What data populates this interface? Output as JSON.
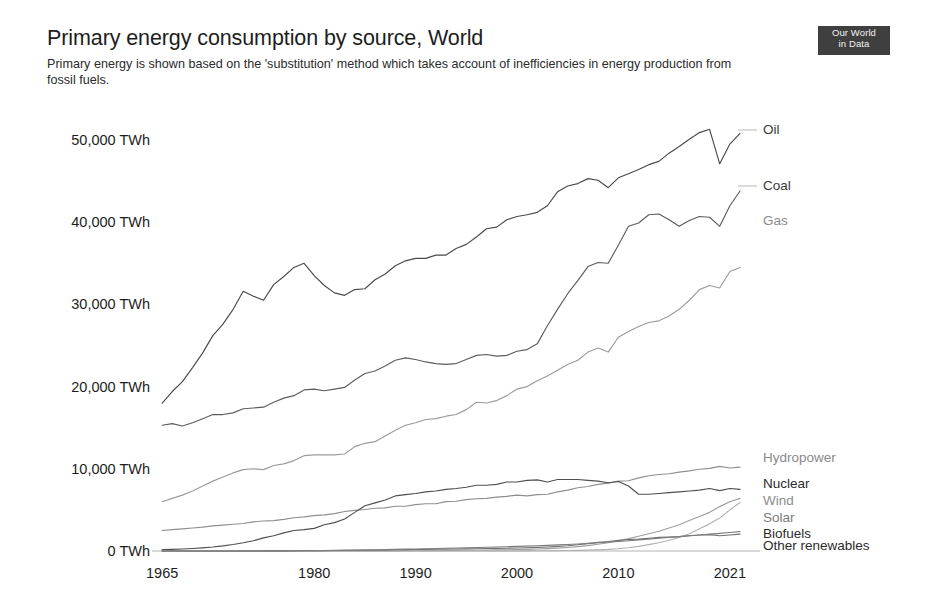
{
  "header": {
    "title": "Primary energy consumption by source, World",
    "subtitle": "Primary energy is shown based on the 'substitution' method which takes account of inefficiencies in energy production from fossil fuels.",
    "logo_line1": "Our World",
    "logo_line2": "in Data"
  },
  "chart_data": {
    "type": "line",
    "title": "Primary energy consumption by source, World",
    "subtitle": "Primary energy is shown based on the 'substitution' method which takes account of inefficiencies in energy production from fossil fuels.",
    "xlabel": "",
    "ylabel": "TWh",
    "xlim": [
      1964,
      2022
    ],
    "ylim": [
      0,
      55000
    ],
    "grid": false,
    "legend_position": "right-inline",
    "x_tick_labels": [
      "1965",
      "1980",
      "1990",
      "2000",
      "2010",
      "2021"
    ],
    "x_ticks": [
      1965,
      1980,
      1990,
      2000,
      2010,
      2021
    ],
    "y_tick_labels": [
      "0 TWh",
      "10,000 TWh",
      "20,000 TWh",
      "30,000 TWh",
      "40,000 TWh",
      "50,000 TWh"
    ],
    "y_ticks": [
      0,
      10000,
      20000,
      30000,
      40000,
      50000
    ],
    "x": [
      1965,
      1966,
      1967,
      1968,
      1969,
      1970,
      1971,
      1972,
      1973,
      1974,
      1975,
      1976,
      1977,
      1978,
      1979,
      1980,
      1981,
      1982,
      1983,
      1984,
      1985,
      1986,
      1987,
      1988,
      1989,
      1990,
      1991,
      1992,
      1993,
      1994,
      1995,
      1996,
      1997,
      1998,
      1999,
      2000,
      2001,
      2002,
      2003,
      2004,
      2005,
      2006,
      2007,
      2008,
      2009,
      2010,
      2011,
      2012,
      2013,
      2014,
      2015,
      2016,
      2017,
      2018,
      2019,
      2020,
      2021,
      2022
    ],
    "series": [
      {
        "name": "Oil",
        "color": "#4a4a4a",
        "label_color": "#3a3a3a",
        "values": [
          18000,
          19400,
          20600,
          22300,
          24100,
          26200,
          27600,
          29400,
          31600,
          31000,
          30500,
          32400,
          33400,
          34500,
          35000,
          33500,
          32300,
          31400,
          31100,
          31800,
          31900,
          33000,
          33700,
          34700,
          35300,
          35600,
          35600,
          36000,
          36000,
          36800,
          37300,
          38200,
          39200,
          39400,
          40300,
          40700,
          40900,
          41200,
          42000,
          43700,
          44400,
          44700,
          45300,
          45100,
          44200,
          45400,
          45900,
          46400,
          47000,
          47400,
          48400,
          49200,
          50100,
          50900,
          51300,
          47100,
          49500,
          50800
        ]
      },
      {
        "name": "Coal",
        "color": "#5d5d5d",
        "label_color": "#3a3a3a",
        "values": [
          15300,
          15500,
          15200,
          15600,
          16100,
          16600,
          16600,
          16800,
          17300,
          17400,
          17500,
          18100,
          18600,
          18900,
          19600,
          19700,
          19500,
          19700,
          19900,
          20800,
          21600,
          21900,
          22500,
          23200,
          23500,
          23300,
          23000,
          22800,
          22700,
          22800,
          23300,
          23800,
          23900,
          23700,
          23800,
          24300,
          24500,
          25200,
          27400,
          29400,
          31300,
          32900,
          34600,
          35100,
          35000,
          37200,
          39500,
          39900,
          40900,
          41000,
          40300,
          39500,
          40200,
          40700,
          40600,
          39500,
          42000,
          43800
        ]
      },
      {
        "name": "Gas",
        "color": "#9b9b9b",
        "label_color": "#8a8a8a",
        "values": [
          6000,
          6400,
          6800,
          7300,
          7900,
          8500,
          9000,
          9500,
          9900,
          10000,
          9900,
          10400,
          10600,
          11000,
          11600,
          11700,
          11700,
          11700,
          11800,
          12700,
          13100,
          13300,
          14000,
          14700,
          15300,
          15600,
          16000,
          16100,
          16400,
          16600,
          17200,
          18100,
          18000,
          18300,
          18900,
          19700,
          20000,
          20700,
          21300,
          22000,
          22700,
          23200,
          24200,
          24700,
          24200,
          26000,
          26700,
          27300,
          27800,
          28000,
          28600,
          29400,
          30500,
          31800,
          32300,
          32000,
          34000,
          34500
        ]
      },
      {
        "name": "Hydropower",
        "color": "#8f8f8f",
        "label_color": "#8a8a8a",
        "values": [
          2500,
          2600,
          2700,
          2800,
          2900,
          3050,
          3150,
          3250,
          3350,
          3550,
          3650,
          3700,
          3850,
          4050,
          4150,
          4300,
          4400,
          4550,
          4800,
          4950,
          5050,
          5200,
          5250,
          5450,
          5450,
          5650,
          5750,
          5750,
          6000,
          6050,
          6250,
          6350,
          6400,
          6550,
          6650,
          6800,
          6700,
          6850,
          6900,
          7200,
          7400,
          7700,
          7850,
          8100,
          8250,
          8500,
          8550,
          8900,
          9150,
          9300,
          9400,
          9600,
          9750,
          9950,
          10050,
          10300,
          10100,
          10200
        ]
      },
      {
        "name": "Nuclear",
        "color": "#4f4f4f",
        "label_color": "#2b2b2b",
        "values": [
          160,
          200,
          240,
          300,
          380,
          480,
          620,
          790,
          1000,
          1250,
          1600,
          1850,
          2200,
          2500,
          2600,
          2750,
          3200,
          3450,
          3900,
          4700,
          5500,
          5850,
          6200,
          6700,
          6850,
          7000,
          7200,
          7300,
          7500,
          7600,
          7750,
          8000,
          8000,
          8100,
          8400,
          8400,
          8600,
          8650,
          8400,
          8700,
          8700,
          8700,
          8600,
          8500,
          8300,
          8450,
          7900,
          6900,
          6900,
          7000,
          7100,
          7200,
          7300,
          7400,
          7600,
          7350,
          7600,
          7500
        ]
      },
      {
        "name": "Wind",
        "color": "#9e9e9e",
        "label_color": "#8d8d8d",
        "values": [
          0,
          0,
          0,
          0,
          0,
          0,
          0,
          0,
          0,
          0,
          0,
          0,
          0,
          0,
          0,
          0,
          0,
          0,
          0,
          5,
          8,
          12,
          16,
          20,
          25,
          30,
          38,
          48,
          58,
          70,
          85,
          95,
          110,
          130,
          150,
          175,
          200,
          240,
          290,
          350,
          430,
          530,
          650,
          820,
          1000,
          1250,
          1500,
          1800,
          2100,
          2400,
          2800,
          3200,
          3700,
          4200,
          4700,
          5400,
          6000,
          6400
        ]
      },
      {
        "name": "Solar",
        "color": "#b0b0b0",
        "label_color": "#7a7a7a",
        "values": [
          0,
          0,
          0,
          0,
          0,
          0,
          0,
          0,
          0,
          0,
          0,
          0,
          0,
          0,
          0,
          0,
          0,
          0,
          0,
          0,
          0,
          0,
          0,
          0,
          0,
          1,
          2,
          3,
          4,
          5,
          6,
          8,
          10,
          12,
          14,
          16,
          20,
          25,
          32,
          42,
          55,
          75,
          100,
          140,
          190,
          270,
          390,
          560,
          780,
          1000,
          1300,
          1650,
          2100,
          2700,
          3300,
          4000,
          5000,
          5900
        ]
      },
      {
        "name": "Biofuels",
        "color": "#6f6f6f",
        "label_color": "#2b2b2b",
        "values": [
          0,
          0,
          0,
          0,
          0,
          0,
          0,
          0,
          0,
          0,
          10,
          15,
          20,
          25,
          30,
          40,
          50,
          60,
          75,
          90,
          105,
          120,
          135,
          150,
          165,
          180,
          195,
          210,
          225,
          240,
          260,
          280,
          300,
          320,
          340,
          370,
          400,
          440,
          490,
          560,
          640,
          760,
          900,
          1050,
          1150,
          1300,
          1400,
          1450,
          1550,
          1650,
          1700,
          1750,
          1850,
          1950,
          2000,
          1850,
          1950,
          2050
        ]
      },
      {
        "name": "Other renewables",
        "color": "#7d7d7d",
        "label_color": "#2b2b2b",
        "values": [
          0,
          0,
          0,
          0,
          0,
          0,
          0,
          0,
          0,
          0,
          5,
          10,
          15,
          20,
          30,
          40,
          55,
          70,
          85,
          105,
          125,
          145,
          170,
          195,
          220,
          250,
          280,
          310,
          340,
          370,
          400,
          430,
          460,
          490,
          520,
          560,
          600,
          640,
          690,
          740,
          790,
          850,
          920,
          1000,
          1070,
          1150,
          1250,
          1350,
          1450,
          1550,
          1650,
          1750,
          1850,
          1950,
          2050,
          2150,
          2250,
          2350
        ]
      }
    ]
  },
  "axis": {
    "y_labels": [
      "50,000 TWh",
      "40,000 TWh",
      "30,000 TWh",
      "20,000 TWh",
      "10,000 TWh",
      "0 TWh"
    ],
    "x_labels": [
      "1965",
      "1980",
      "1990",
      "2000",
      "2010",
      "2021"
    ]
  },
  "series_labels": [
    {
      "name": "Oil",
      "y": 130,
      "color": "#3a3a3a",
      "connector": true,
      "connector_y": 130,
      "connector_from": 738,
      "connector_to": 757
    },
    {
      "name": "Coal",
      "y": 186,
      "color": "#3a3a3a",
      "connector": true,
      "connector_y": 186,
      "connector_from": 738,
      "connector_to": 757
    },
    {
      "name": "Gas",
      "y": 221,
      "color": "#8a8a8a",
      "connector": false
    },
    {
      "name": "Hydropower",
      "y": 458,
      "color": "#8a8a8a",
      "connector": false
    },
    {
      "name": "Nuclear",
      "y": 484,
      "color": "#2b2b2b",
      "connector": false
    },
    {
      "name": "Wind",
      "y": 501,
      "color": "#8d8d8d",
      "connector": false
    },
    {
      "name": "Solar",
      "y": 518,
      "color": "#7a7a7a",
      "connector": false
    },
    {
      "name": "Biofuels",
      "y": 534,
      "color": "#2b2b2b",
      "connector": false
    },
    {
      "name": "Other renewables",
      "y": 546,
      "color": "#2b2b2b",
      "connector": false
    }
  ]
}
